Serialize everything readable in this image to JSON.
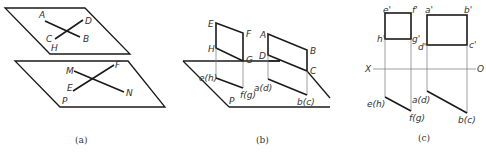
{
  "figure_a": {
    "caption": "(a)",
    "upper_plane": {
      "label": "H",
      "line1": {
        "start": "A",
        "end": "B"
      },
      "line2": {
        "start": "D",
        "end": "C"
      }
    },
    "lower_plane": {
      "label": "P",
      "line1": {
        "start": "M",
        "end": "N"
      },
      "line2": {
        "start": "F",
        "end": "E"
      }
    }
  },
  "figure_b": {
    "caption": "(b)",
    "plane_label": "P",
    "rect1": {
      "E": "E",
      "F": "F",
      "G": "G",
      "H": "H"
    },
    "rect1_projection": {
      "eh": "e(h)",
      "fg": "f(g)"
    },
    "rect2": {
      "A": "A",
      "B": "B",
      "C": "C",
      "D": "D"
    },
    "rect2_projection": {
      "ad": "a(d)",
      "bc": "b(c)"
    }
  },
  "figure_c": {
    "caption": "(c)",
    "axis": {
      "left": "X",
      "right": "O"
    },
    "square": {
      "e": "e'",
      "f": "f'",
      "g": "g'",
      "h": "h'"
    },
    "rect": {
      "a": "a'",
      "b": "b'",
      "c": "c'",
      "d": "d'"
    },
    "bottom": {
      "eh": "e(h)",
      "fg": "f(g)",
      "ad": "a(d)",
      "bc": "b(c)"
    }
  }
}
